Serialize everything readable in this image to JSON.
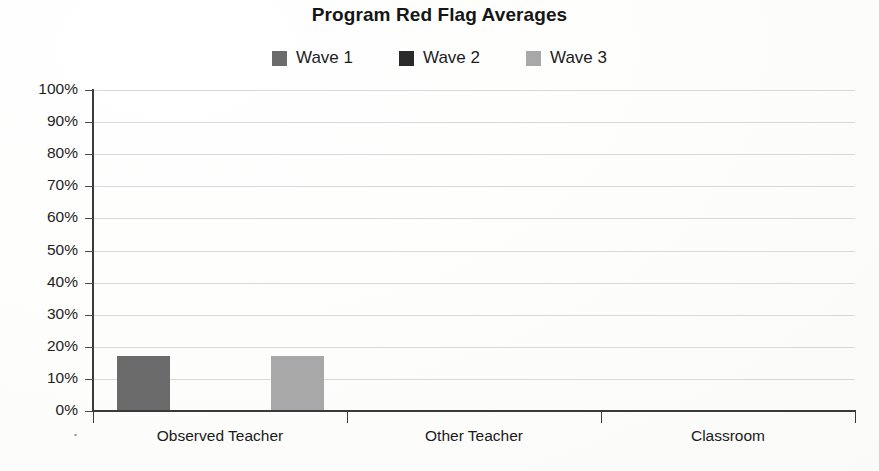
{
  "chart_data": {
    "type": "bar",
    "title": "Program Red Flag Averages",
    "xlabel": "",
    "ylabel": "",
    "categories": [
      "Observed Teacher",
      "Other Teacher",
      "Classroom"
    ],
    "series": [
      {
        "name": "Wave 1",
        "color": "#6b6b6b",
        "values": [
          17,
          0,
          0
        ]
      },
      {
        "name": "Wave 2",
        "color": "#2a2a2a",
        "values": [
          0,
          0,
          0
        ]
      },
      {
        "name": "Wave 3",
        "color": "#a8a8a8",
        "values": [
          17,
          0,
          0
        ]
      }
    ],
    "ylim": [
      0,
      100
    ],
    "y_ticks": [
      "0%",
      "10%",
      "20%",
      "30%",
      "40%",
      "50%",
      "60%",
      "70%",
      "80%",
      "90%",
      "100%"
    ],
    "y_tick_values": [
      0,
      10,
      20,
      30,
      40,
      50,
      60,
      70,
      80,
      90,
      100
    ],
    "grid": true,
    "grid_color": "#d9d9dd",
    "legend_position": "top",
    "axis_color": "#3a3a3a",
    "background": "#ffffff"
  },
  "legend": {
    "items": [
      {
        "label": "Wave 1",
        "color": "#6b6b6b"
      },
      {
        "label": "Wave 2",
        "color": "#2a2a2a"
      },
      {
        "label": "Wave 3",
        "color": "#a8a8a8"
      }
    ]
  },
  "y_axis": {
    "labels": [
      "100%",
      "90%",
      "80%",
      "70%",
      "60%",
      "50%",
      "40%",
      "30%",
      "20%",
      "10%",
      "0%"
    ]
  },
  "x_axis": {
    "labels": [
      "Observed Teacher",
      "Other Teacher",
      "Classroom"
    ]
  }
}
